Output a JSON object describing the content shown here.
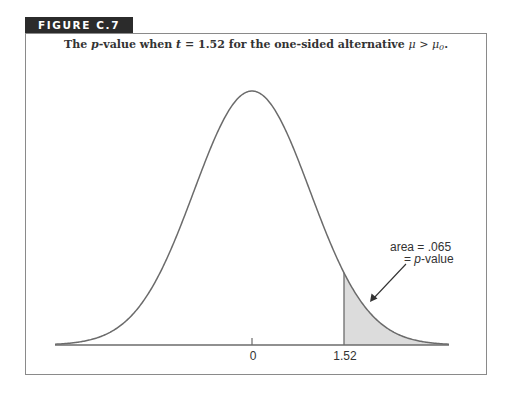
{
  "figure": {
    "label": "FIGURE C.7",
    "caption": {
      "prefix": "The ",
      "p_italic": "p",
      "mid": "-value when ",
      "t_italic": "t",
      "mid2": " = 1.52 for the one-sided alternative ",
      "mu": "μ",
      "gt": " > ",
      "mu0": "μ",
      "sub0": "0",
      "suffix": "."
    },
    "annotation": {
      "line1": "area = .065",
      "line2_prefix": "= ",
      "line2_italic": "p",
      "line2_suffix": "-value"
    }
  },
  "colors": {
    "curve": "#6b6b6b",
    "axis": "#6b6b6b",
    "shade": "#dcdcdc",
    "frame": "#8a8a8a",
    "label_bg": "#2b2b2b"
  },
  "chart_data": {
    "type": "area",
    "title": "The p-value when t = 1.52 for the one-sided alternative μ > μ0.",
    "distribution": "standard normal (t) density",
    "xlabel": "",
    "ylabel": "",
    "x_ticks": [
      0,
      1.52
    ],
    "tick_labels": [
      "0",
      "1.52"
    ],
    "xlim": [
      -3.4,
      3.4
    ],
    "shaded_region": {
      "from": 1.52,
      "to": 3.4,
      "area": 0.065,
      "label": "area = .065 = p-value"
    },
    "grid": false,
    "legend": null
  },
  "layout": {
    "cx": 252,
    "baseline": 345,
    "peak_y": 91,
    "sigma_px": 58,
    "x_left": 55,
    "x_right": 449,
    "t_value": 1.52
  }
}
